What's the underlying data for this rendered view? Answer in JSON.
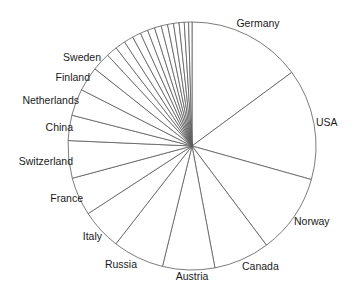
{
  "chart_data": {
    "type": "pie",
    "title": "",
    "start_angle_deg": 0,
    "direction": "clockwise",
    "center": [
      192,
      146
    ],
    "radius": 124,
    "colors": {
      "fill": "#ffffff",
      "stroke": "#5a5a5a",
      "label": "#1a1a1a"
    },
    "slices": [
      {
        "label": "Germany",
        "value": 14.9,
        "label_pos": [
          258,
          27
        ],
        "anchor": "middle"
      },
      {
        "label": "USA",
        "value": 14.5,
        "label_pos": [
          316,
          126
        ],
        "anchor": "start"
      },
      {
        "label": "Norway",
        "value": 10.4,
        "label_pos": [
          294,
          225
        ],
        "anchor": "start"
      },
      {
        "label": "Canada",
        "value": 7.3,
        "label_pos": [
          242,
          270
        ],
        "anchor": "start"
      },
      {
        "label": "Austria",
        "value": 6.8,
        "label_pos": [
          192,
          280
        ],
        "anchor": "middle"
      },
      {
        "label": "Russia",
        "value": 6.7,
        "label_pos": [
          137,
          268
        ],
        "anchor": "end"
      },
      {
        "label": "Italy",
        "value": 5.3,
        "label_pos": [
          102,
          240
        ],
        "anchor": "end"
      },
      {
        "label": "France",
        "value": 5.0,
        "label_pos": [
          83,
          202
        ],
        "anchor": "end"
      },
      {
        "label": "Switzerland",
        "value": 4.9,
        "label_pos": [
          73,
          165
        ],
        "anchor": "end"
      },
      {
        "label": "China",
        "value": 3.3,
        "label_pos": [
          73,
          131
        ],
        "anchor": "end"
      },
      {
        "label": "Netherlands",
        "value": 3.5,
        "label_pos": [
          79,
          104
        ],
        "anchor": "end"
      },
      {
        "label": "Finland",
        "value": 3.2,
        "label_pos": [
          90,
          81
        ],
        "anchor": "end"
      },
      {
        "label": "Sweden",
        "value": 2.4,
        "label_pos": [
          101,
          61
        ],
        "anchor": "end"
      },
      {
        "label": "",
        "value": 1.44
      },
      {
        "label": "",
        "value": 1.33
      },
      {
        "label": "",
        "value": 1.22
      },
      {
        "label": "",
        "value": 1.11
      },
      {
        "label": "",
        "value": 1.0
      },
      {
        "label": "",
        "value": 0.94
      },
      {
        "label": "",
        "value": 0.89
      },
      {
        "label": "",
        "value": 0.83
      },
      {
        "label": "",
        "value": 0.78
      },
      {
        "label": "",
        "value": 0.72
      },
      {
        "label": "",
        "value": 0.67
      },
      {
        "label": "",
        "value": 0.56
      },
      {
        "label": "",
        "value": 0.44
      }
    ],
    "legend": "none",
    "labels_outside": true
  }
}
